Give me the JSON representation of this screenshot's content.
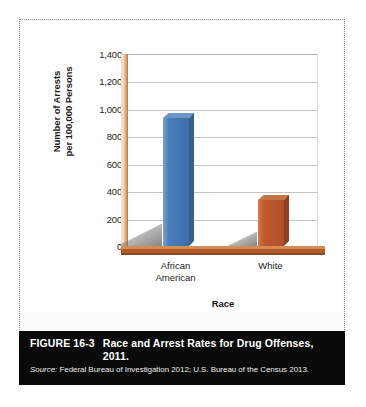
{
  "figure": {
    "number": "FIGURE 16-3",
    "title": "Race and Arrest Rates for Drug Offenses, 2011.",
    "source_label": "Source:",
    "source_text": " Federal Bureau of Investigation 2012; U.S. Bureau of the Census 2013."
  },
  "colors": {
    "bar_african_american": "#4a7ebb",
    "bar_white": "#c0582c",
    "axis_wall": "#d99a63",
    "floor": "#b45a27",
    "gridline": "#c4c4c4",
    "caption_background": "#0a0a0a",
    "caption_text": "#ffffff",
    "shadow": "#787878"
  },
  "chart_data": {
    "type": "bar",
    "title": "Race and Arrest Rates for Drug Offenses, 2011.",
    "categories": [
      "African American",
      "White"
    ],
    "category_lines": [
      [
        "African",
        "American"
      ],
      [
        "White"
      ]
    ],
    "values": [
      930,
      335
    ],
    "xlabel": "Race",
    "ylabel": "Number of Arrests per 100,000 Persons",
    "ylabel_lines": [
      "Number of Arrests",
      "per 100,000 Persons"
    ],
    "ylim": [
      0,
      1400
    ],
    "ytick_values": [
      0,
      200,
      400,
      600,
      800,
      1000,
      1200,
      1400
    ],
    "ytick_labels": [
      "0",
      "200",
      "400",
      "600",
      "800",
      "1,000",
      "1,200",
      "1,400"
    ],
    "grid": true,
    "legend": false,
    "legend_position": "none",
    "series": [
      {
        "name": "Number of Arrests per 100,000 Persons",
        "values": [
          930,
          335
        ],
        "colors": [
          "#4a7ebb",
          "#c0582c"
        ]
      }
    ]
  }
}
